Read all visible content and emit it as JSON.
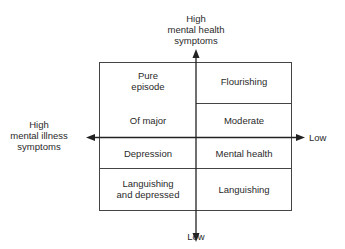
{
  "axes": {
    "top": {
      "line1": "High",
      "line2": "mental health",
      "line3": "symptoms"
    },
    "bottom": "Low",
    "left": {
      "line1": "High",
      "line2": "mental illness",
      "line3": "symptoms"
    },
    "right": "Low"
  },
  "cells": {
    "left_col": {
      "row1": {
        "line1": "Pure",
        "line2": "episode"
      },
      "row2": "Of major",
      "row3": "Depression",
      "row4": {
        "line1": "Languishing",
        "line2": "and depressed"
      }
    },
    "right_col": {
      "row1": "Flourishing",
      "row2": "Moderate",
      "row3": "Mental health",
      "row4": "Languishing"
    }
  },
  "colors": {
    "line": "#333333",
    "text": "#2a2a2a"
  }
}
